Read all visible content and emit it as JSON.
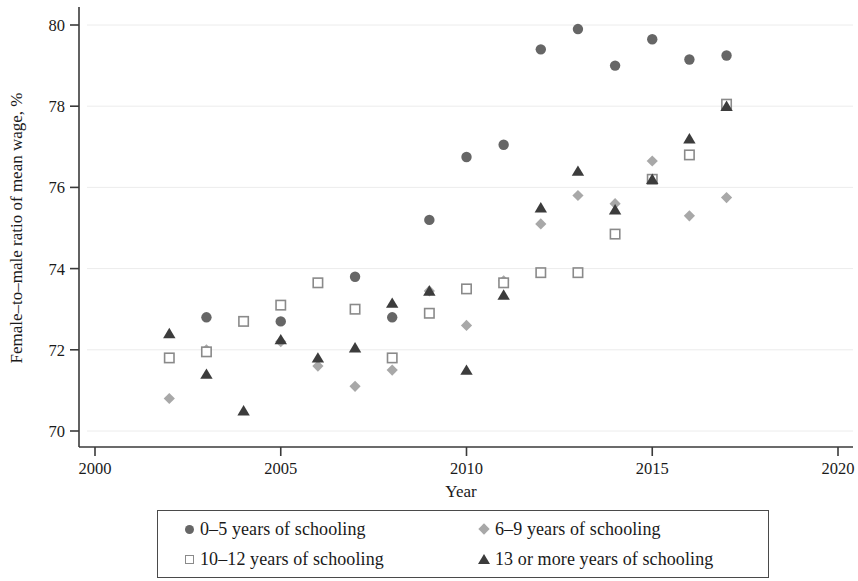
{
  "chart_data": {
    "type": "scatter",
    "title": "",
    "xlabel": "Year",
    "ylabel": "Female–to–male ratio of mean wage, %",
    "xlim": [
      2000,
      2020
    ],
    "ylim": [
      70,
      80
    ],
    "xticks": [
      2000,
      2005,
      2010,
      2015,
      2020
    ],
    "xtick_labels": [
      "2000",
      "2005",
      "2010",
      "2015",
      "2020"
    ],
    "yticks": [
      70,
      72,
      74,
      76,
      78,
      80
    ],
    "ytick_labels": [
      "70",
      "72",
      "74",
      "76",
      "78",
      "80"
    ],
    "grid": "horizontal",
    "legend_position": "below-axes",
    "series": [
      {
        "name": "0–5 years of schooling",
        "marker": "filled-circle",
        "color": "#666666",
        "x": [
          2003,
          2005,
          2007,
          2008,
          2009,
          2010,
          2011,
          2012,
          2013,
          2014,
          2015,
          2016,
          2017
        ],
        "y": [
          72.8,
          72.7,
          73.8,
          72.8,
          75.2,
          76.75,
          77.05,
          79.4,
          79.9,
          79.0,
          79.65,
          79.15,
          79.25
        ]
      },
      {
        "name": "6–9 years of schooling",
        "marker": "filled-diamond",
        "color": "#a8a8a8",
        "x": [
          2002,
          2003,
          2005,
          2006,
          2007,
          2008,
          2009,
          2010,
          2011,
          2012,
          2013,
          2014,
          2015,
          2016,
          2017
        ],
        "y": [
          70.8,
          72.0,
          72.2,
          71.6,
          71.1,
          71.5,
          73.45,
          72.6,
          73.7,
          75.1,
          75.8,
          75.6,
          76.65,
          75.3,
          75.75
        ]
      },
      {
        "name": "10–12 years of schooling",
        "marker": "open-square",
        "color": "#8a8a8a",
        "x": [
          2002,
          2003,
          2004,
          2005,
          2006,
          2007,
          2008,
          2009,
          2010,
          2011,
          2012,
          2013,
          2014,
          2015,
          2016,
          2017
        ],
        "y": [
          71.8,
          71.95,
          72.7,
          73.1,
          73.65,
          73.0,
          71.8,
          72.9,
          73.5,
          73.65,
          73.9,
          73.9,
          74.85,
          76.2,
          76.8,
          78.05
        ]
      },
      {
        "name": "13 or more years of schooling",
        "marker": "filled-triangle",
        "color": "#3c3c3c",
        "x": [
          2002,
          2003,
          2004,
          2005,
          2006,
          2007,
          2008,
          2009,
          2010,
          2011,
          2012,
          2013,
          2014,
          2015,
          2016,
          2017
        ],
        "y": [
          72.4,
          71.4,
          70.5,
          72.25,
          71.8,
          72.05,
          73.15,
          73.45,
          71.5,
          73.35,
          75.5,
          76.4,
          75.45,
          76.2,
          77.2,
          78.0
        ]
      }
    ]
  },
  "axes": {
    "xlabel": "Year",
    "ylabel": "Female–to–male ratio of mean wage, %"
  },
  "legend": {
    "items": [
      {
        "label": "0–5 years of schooling",
        "marker": "filled-circle"
      },
      {
        "label": "6–9 years of schooling",
        "marker": "filled-diamond"
      },
      {
        "label": "10–12 years of schooling",
        "marker": "open-square"
      },
      {
        "label": "13 or more years of schooling",
        "marker": "filled-triangle"
      }
    ]
  },
  "colors": {
    "series_0_5": "#666666",
    "series_6_9": "#a8a8a8",
    "series_10_12": "#8a8a8a",
    "series_13_plus": "#3c3c3c",
    "axis": "#3a3a3a",
    "grid": "#ececec"
  }
}
